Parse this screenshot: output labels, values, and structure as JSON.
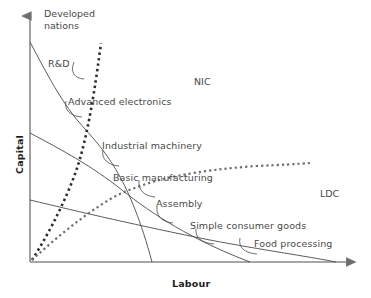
{
  "diagram": {
    "title_region_labels": {
      "developed": "Developed\nnations",
      "nic": "NIC",
      "ldc": "LDC"
    },
    "axes": {
      "y_label": "Capital",
      "x_label": "Labour"
    },
    "industry_labels": [
      "R&D",
      "Advanced electronics",
      "Industrial machinery",
      "Basic manufacturing",
      "Assembly",
      "Simple consumer goods",
      "Food processing"
    ],
    "colors": {
      "axis": "#808080",
      "curve": "#3c3c3c",
      "dotted": "#2a2a2a",
      "dotted_light": "#6e6e6e",
      "text": "#4a4a4a",
      "axis_text": "#1d1d1d",
      "background": "#ffffff"
    }
  }
}
